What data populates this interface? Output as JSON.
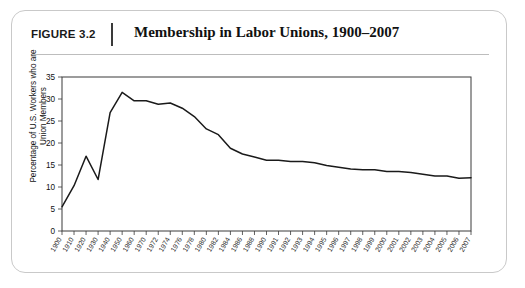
{
  "figure": {
    "number_label": "FIGURE 3.2",
    "title": "Membership in Labor Unions, 1900–2007"
  },
  "chart_data": {
    "type": "line",
    "title": "Membership in Labor Unions, 1900–2007",
    "xlabel": "",
    "ylabel": "Percentage of U.S. Workers who are Union Members",
    "ylim": [
      0,
      35
    ],
    "ytick_values": [
      0,
      5,
      10,
      15,
      20,
      25,
      30,
      35
    ],
    "ytick_labels": [
      "0",
      "5",
      "10",
      "15",
      "20",
      "25",
      "30",
      "35"
    ],
    "grid": false,
    "legend": "none",
    "xtick_labels": [
      "1900",
      "1910",
      "1920",
      "1930",
      "1940",
      "1950",
      "1960",
      "1970",
      "1972",
      "1974",
      "1976",
      "1978",
      "1980",
      "1982",
      "1984",
      "1986",
      "1988",
      "1990",
      "1991",
      "1992",
      "1993",
      "1994",
      "1995",
      "1996",
      "1997",
      "1998",
      "1999",
      "2000",
      "2001",
      "2002",
      "2003",
      "2004",
      "2005",
      "2006",
      "2007"
    ],
    "x": [
      "1900",
      "1910",
      "1920",
      "1930",
      "1940",
      "1950",
      "1960",
      "1970",
      "1972",
      "1974",
      "1976",
      "1978",
      "1980",
      "1982",
      "1984",
      "1986",
      "1988",
      "1990",
      "1991",
      "1992",
      "1993",
      "1994",
      "1995",
      "1996",
      "1997",
      "1998",
      "1999",
      "2000",
      "2001",
      "2002",
      "2003",
      "2004",
      "2005",
      "2006",
      "2007"
    ],
    "values": [
      5.5,
      10.3,
      17.0,
      11.7,
      26.9,
      31.5,
      29.6,
      29.6,
      28.8,
      29.1,
      27.9,
      26.0,
      23.2,
      21.9,
      18.8,
      17.5,
      16.8,
      16.1,
      16.1,
      15.8,
      15.8,
      15.5,
      14.9,
      14.5,
      14.1,
      13.9,
      13.9,
      13.5,
      13.5,
      13.3,
      12.9,
      12.5,
      12.5,
      12.0,
      12.1
    ]
  }
}
